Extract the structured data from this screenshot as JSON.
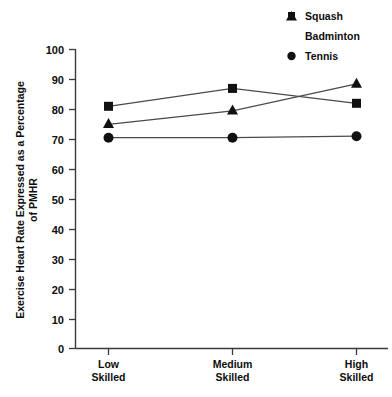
{
  "chart_data": {
    "type": "line",
    "title": "",
    "xlabel": "",
    "ylabel": "Exercise Heart Rate Expressed as a Percentage of PMHR",
    "ylabel_line1": "Exercise Heart Rate Expressed as a Percentage",
    "ylabel_line2": "of PMHR",
    "categories": [
      "Low Skilled",
      "Medium Skilled",
      "High Skilled"
    ],
    "category_lines": [
      {
        "line1": "Low",
        "line2": "Skilled"
      },
      {
        "line1": "Medium",
        "line2": "Skilled"
      },
      {
        "line1": "High",
        "line2": "Skilled"
      }
    ],
    "ylim": [
      0,
      100
    ],
    "yticks": [
      0,
      10,
      20,
      30,
      40,
      50,
      60,
      70,
      80,
      90,
      100
    ],
    "ytick_labels": [
      "0",
      "10",
      "20",
      "30",
      "40",
      "50",
      "60",
      "70",
      "80",
      "90",
      "100"
    ],
    "grid": false,
    "legend_position": "top-right",
    "series": [
      {
        "name": "Squash",
        "marker": "square",
        "values": [
          81,
          87,
          82
        ]
      },
      {
        "name": "Badminton",
        "marker": "triangle",
        "values": [
          75,
          79.5,
          88.5
        ]
      },
      {
        "name": "Tennis",
        "marker": "circle",
        "values": [
          70.5,
          70.5,
          71
        ]
      }
    ]
  },
  "legend": {
    "items": [
      {
        "label": "Squash",
        "marker": "square"
      },
      {
        "label": "Badminton",
        "marker": "triangle"
      },
      {
        "label": "Tennis",
        "marker": "circle"
      }
    ]
  },
  "colors": {
    "ink": "#111111",
    "axis": "#3a3a3a",
    "line": "#4a4a4a",
    "background": "#ffffff"
  }
}
